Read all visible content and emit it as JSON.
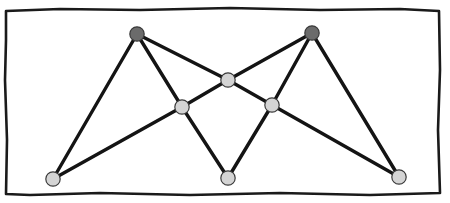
{
  "figure": {
    "title": "",
    "canvas": {
      "width": 450,
      "height": 203,
      "background": "#ffffff"
    },
    "frame": {
      "name": "hand-drawn-rectangular-border",
      "stroke": "#1a1a1a",
      "stroke_width": 2.6,
      "style": "sketchy",
      "path": "M 6 11 L 60 9 L 140 10 L 230 8 L 320 10 L 400 9 L 439 11 L 440 70 L 438 130 L 440 193 L 370 195 L 280 193 L 190 195 L 100 193 L 30 195 L 6 194 L 7 140 L 5 80 L 6 40 Z"
    }
  },
  "graph_data": {
    "type": "graph",
    "description": "Undirected straight-line graph drawing with 8 vertices and 11 edges, drawn as two overlapping zig-zag chains forming a double-peak pattern",
    "vertex_count": 8,
    "edge_count": 11,
    "edge_stroke": "#141414",
    "edge_stroke_width": 3.4,
    "vertex_radius": 7.2,
    "vertex_stroke": "#3a3a3a",
    "vertex_stroke_width": 1.2,
    "colors": {
      "dark_vertex_fill": "#6b6b6b",
      "light_vertex_fill": "#d4d4d4",
      "edge": "#141414",
      "border": "#1a1a1a",
      "background": "#ffffff"
    },
    "vertices": [
      {
        "id": "A",
        "label": "",
        "x": 137,
        "y": 34,
        "fill": "#6b6b6b",
        "shade": "dark",
        "role": "left-peak"
      },
      {
        "id": "B",
        "label": "",
        "x": 312,
        "y": 33,
        "fill": "#6b6b6b",
        "shade": "dark",
        "role": "right-peak"
      },
      {
        "id": "C",
        "label": "",
        "x": 228,
        "y": 80,
        "fill": "#d4d4d4",
        "shade": "light",
        "role": "center-upper"
      },
      {
        "id": "D",
        "label": "",
        "x": 182,
        "y": 107,
        "fill": "#d4d4d4",
        "shade": "light",
        "role": "left-middle"
      },
      {
        "id": "E",
        "label": "",
        "x": 272,
        "y": 105,
        "fill": "#d4d4d4",
        "shade": "light",
        "role": "right-middle"
      },
      {
        "id": "F",
        "label": "",
        "x": 53,
        "y": 179,
        "fill": "#d4d4d4",
        "shade": "light",
        "role": "bottom-left"
      },
      {
        "id": "G",
        "label": "",
        "x": 228,
        "y": 178,
        "fill": "#d4d4d4",
        "shade": "light",
        "role": "bottom-center"
      },
      {
        "id": "H",
        "label": "",
        "x": 399,
        "y": 177,
        "fill": "#d4d4d4",
        "shade": "light",
        "role": "bottom-right"
      }
    ],
    "edges": [
      {
        "id": "e1",
        "source": "A",
        "target": "F"
      },
      {
        "id": "e2",
        "source": "A",
        "target": "D"
      },
      {
        "id": "e3",
        "source": "A",
        "target": "C"
      },
      {
        "id": "e4",
        "source": "C",
        "target": "B"
      },
      {
        "id": "e5",
        "source": "B",
        "target": "E"
      },
      {
        "id": "e6",
        "source": "B",
        "target": "H"
      },
      {
        "id": "e7",
        "source": "F",
        "target": "D"
      },
      {
        "id": "e8",
        "source": "D",
        "target": "C"
      },
      {
        "id": "e9",
        "source": "C",
        "target": "E"
      },
      {
        "id": "e10",
        "source": "E",
        "target": "H"
      },
      {
        "id": "e11",
        "source": "D",
        "target": "G"
      },
      {
        "id": "e12",
        "source": "G",
        "target": "E"
      }
    ]
  }
}
